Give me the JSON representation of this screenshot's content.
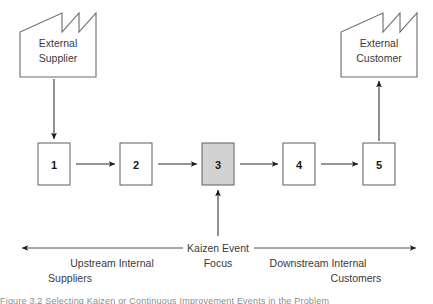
{
  "diagram": {
    "colors": {
      "background": "#ffffff",
      "box_fill": "#ffffff",
      "box_highlight_fill": "#d2d2d2",
      "box_stroke": "#6b6b6b",
      "arrow": "#1a1a1a",
      "text": "#3a3a3a"
    },
    "external_supplier": {
      "label_line1": "External",
      "label_line2": "Supplier",
      "shape": "factory"
    },
    "external_customer": {
      "label_line1": "External",
      "label_line2": "Customer",
      "shape": "factory"
    },
    "process_steps": [
      {
        "number": "1",
        "highlighted": false
      },
      {
        "number": "2",
        "highlighted": false
      },
      {
        "number": "3",
        "highlighted": true
      },
      {
        "number": "4",
        "highlighted": false
      },
      {
        "number": "5",
        "highlighted": false
      }
    ],
    "kaizen_focus": {
      "line1": "Kaizen Event",
      "line2": "Focus"
    },
    "upstream": {
      "line1": "Upstream Internal",
      "line2": "Suppliers"
    },
    "downstream": {
      "line1": "Downstream Internal",
      "line2": "Customers"
    },
    "caption": {
      "text": "Figure 3.2  Selecting Kaizen or Continuous Improvement Events in the Problem"
    }
  }
}
